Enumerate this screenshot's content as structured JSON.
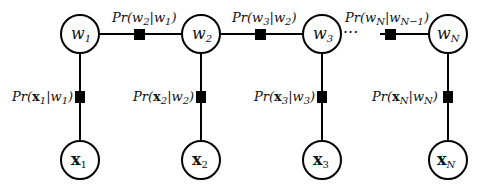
{
  "diagram": {
    "type": "factor-graph-chain",
    "hidden_nodes": [
      {
        "id": "w1",
        "label": "w",
        "sub": "1"
      },
      {
        "id": "w2",
        "label": "w",
        "sub": "2"
      },
      {
        "id": "w3",
        "label": "w",
        "sub": "3"
      },
      {
        "id": "wN",
        "label": "w",
        "sub": "N"
      }
    ],
    "observed_nodes": [
      {
        "id": "x1",
        "label": "x",
        "sub": "1"
      },
      {
        "id": "x2",
        "label": "x",
        "sub": "2"
      },
      {
        "id": "x3",
        "label": "x",
        "sub": "3"
      },
      {
        "id": "xN",
        "label": "x",
        "sub": "N"
      }
    ],
    "transition_factors": [
      {
        "label": "Pr(w2|w1)",
        "pre": "Pr(w",
        "a": "2",
        "mid": "|w",
        "b": "1",
        "post": ")"
      },
      {
        "label": "Pr(w3|w2)",
        "pre": "Pr(w",
        "a": "3",
        "mid": "|w",
        "b": "2",
        "post": ")"
      },
      {
        "label": "Pr(wN|wN-1)",
        "pre": "Pr(w",
        "a": "N",
        "mid": "|w",
        "b": "N−1",
        "post": ")"
      }
    ],
    "emission_factors": [
      {
        "label": "Pr(x1|w1)",
        "pre": "Pr(",
        "x": "x",
        "a": "1",
        "mid": "|w",
        "b": "1",
        "post": ")"
      },
      {
        "label": "Pr(x2|w2)",
        "pre": "Pr(",
        "x": "x",
        "a": "2",
        "mid": "|w",
        "b": "2",
        "post": ")"
      },
      {
        "label": "Pr(x3|w3)",
        "pre": "Pr(",
        "x": "x",
        "a": "3",
        "mid": "|w",
        "b": "3",
        "post": ")"
      },
      {
        "label": "Pr(xN|wN)",
        "pre": "Pr(",
        "x": "x",
        "a": "N",
        "mid": "|w",
        "b": "N",
        "post": ")"
      }
    ],
    "ellipsis": "···",
    "colors": {
      "stroke": "#000000",
      "factor": "#000000",
      "background": "#ffffff"
    }
  }
}
